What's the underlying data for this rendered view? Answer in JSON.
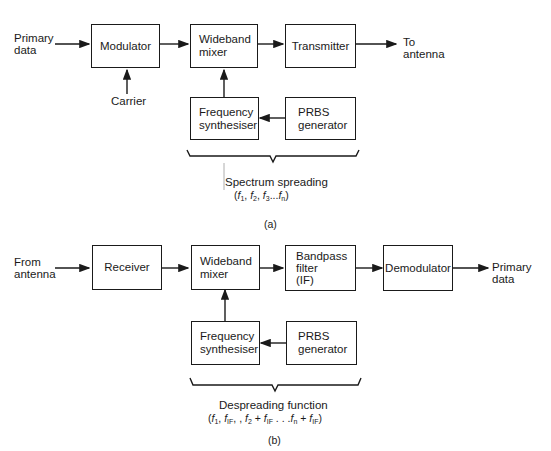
{
  "diagram_a": {
    "input_label": "Primary\ndata",
    "modulator": "Modulator",
    "carrier": "Carrier",
    "mixer": "Wideband\nmixer",
    "transmitter": "Transmitter",
    "output_label": "To\nantenna",
    "synth": "Frequency\nsynthesiser",
    "prbs": "PRBS\ngenerator",
    "brace_title": "Spectrum spreading",
    "brace_formula": "(f1, f2, f3...fn)",
    "caption": "(a)"
  },
  "diagram_b": {
    "input_label": "From\nantenna",
    "receiver": "Receiver",
    "mixer": "Wideband\nmixer",
    "bandpass": "Bandpass\nfilter\n(IF)",
    "demodulator": "Demodulator",
    "output_label": "Primary\ndata",
    "synth": "Frequency\nsynthesiser",
    "prbs": "PRBS\ngenerator",
    "brace_title": "Despreading function",
    "brace_formula": "(f1, fIF, f2 + fIF . . .fn + fIF)",
    "caption": "(b)"
  }
}
